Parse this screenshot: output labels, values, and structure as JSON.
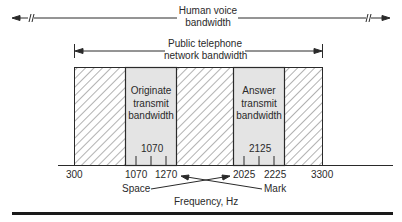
{
  "diagram": {
    "human_voice": {
      "line1": "Human voice",
      "line2": "bandwidth"
    },
    "public_network": {
      "line1": "Public telephone",
      "line2": "network bandwidth"
    },
    "originate": {
      "line1": "Originate",
      "line2": "transmit",
      "line3": "bandwidth",
      "center": "1070"
    },
    "answer": {
      "line1": "Answer",
      "line2": "transmit",
      "line3": "bandwidth",
      "center": "2125"
    },
    "axis_ticks": [
      "300",
      "1070",
      "1270",
      "2025",
      "2225",
      "3300"
    ],
    "space_label": "Space",
    "mark_label": "Mark",
    "axis_label": "Frequency, Hz",
    "colors": {
      "line": "#2a2a2a",
      "passband_fill": "#e4e4e4",
      "hatch": "#555555"
    }
  }
}
